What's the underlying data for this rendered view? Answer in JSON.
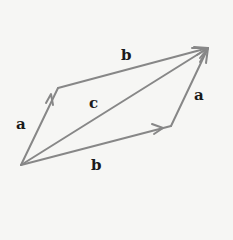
{
  "diagram": {
    "colors": {
      "arrow": "#878787",
      "label": "#1a1a1a",
      "background": "#f6f6f4"
    },
    "points": {
      "O": [
        21,
        165
      ],
      "A": [
        58,
        88
      ],
      "B": [
        171,
        126
      ],
      "C": [
        208,
        48
      ]
    },
    "vectors": [
      {
        "id": "a-left",
        "name": "a",
        "from": "O",
        "to": "A",
        "arrow_at": "mid"
      },
      {
        "id": "b-top",
        "name": "b",
        "from": "A",
        "to": "C",
        "arrow_at": "end"
      },
      {
        "id": "b-bottom",
        "name": "b",
        "from": "O",
        "to": "B",
        "arrow_at": "mid"
      },
      {
        "id": "a-right",
        "name": "a",
        "from": "B",
        "to": "C",
        "arrow_at": "end"
      },
      {
        "id": "c-diag",
        "name": "c",
        "from": "O",
        "to": "C",
        "arrow_at": "end"
      }
    ],
    "labels": [
      {
        "id": "label-a-left",
        "text": "a",
        "x": 16,
        "y": 117
      },
      {
        "id": "label-b-top",
        "text": "b",
        "x": 121,
        "y": 48
      },
      {
        "id": "label-c",
        "text": "c",
        "x": 89,
        "y": 96
      },
      {
        "id": "label-a-right",
        "text": "a",
        "x": 194,
        "y": 88
      },
      {
        "id": "label-b-bottom",
        "text": "b",
        "x": 91,
        "y": 158
      }
    ]
  }
}
